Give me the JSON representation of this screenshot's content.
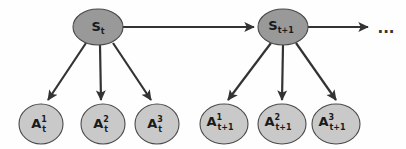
{
  "figure": {
    "title": "",
    "colors": {
      "background": "#fefefe",
      "state_node_fill": "#999999",
      "action_node_fill": "#c9c9c9",
      "node_stroke": "#4a4a4a",
      "edge_stroke": "#333333",
      "label_color": "#1a1a1a"
    },
    "continuation_label": "..."
  },
  "nodes": {
    "state_t": {
      "id": "S_t",
      "base": "S",
      "subscript": "t",
      "superscript": "",
      "kind": "state"
    },
    "state_t1": {
      "id": "S_t+1",
      "base": "S",
      "subscript": "t+1",
      "superscript": "",
      "kind": "state"
    },
    "action_t_1": {
      "id": "A_t^1",
      "base": "A",
      "subscript": "t",
      "superscript": "1",
      "kind": "action"
    },
    "action_t_2": {
      "id": "A_t^2",
      "base": "A",
      "subscript": "t",
      "superscript": "2",
      "kind": "action"
    },
    "action_t_3": {
      "id": "A_t^3",
      "base": "A",
      "subscript": "t",
      "superscript": "3",
      "kind": "action"
    },
    "action_t1_1": {
      "id": "A_t+1^1",
      "base": "A",
      "subscript": "t+1",
      "superscript": "1",
      "kind": "action"
    },
    "action_t1_2": {
      "id": "A_t+1^2",
      "base": "A",
      "subscript": "t+1",
      "superscript": "2",
      "kind": "action"
    },
    "action_t1_3": {
      "id": "A_t+1^3",
      "base": "A",
      "subscript": "t+1",
      "superscript": "3",
      "kind": "action"
    }
  },
  "edges": [
    {
      "from": "S_t",
      "to": "S_t+1",
      "style": "arrow"
    },
    {
      "from": "S_t",
      "to": "A_t^1",
      "style": "arrow"
    },
    {
      "from": "S_t",
      "to": "A_t^2",
      "style": "arrow"
    },
    {
      "from": "S_t",
      "to": "A_t^3",
      "style": "arrow"
    },
    {
      "from": "S_t+1",
      "to": "...",
      "style": "arrow"
    },
    {
      "from": "S_t+1",
      "to": "A_t+1^1",
      "style": "arrow"
    },
    {
      "from": "S_t+1",
      "to": "A_t+1^2",
      "style": "arrow"
    },
    {
      "from": "S_t+1",
      "to": "A_t+1^3",
      "style": "arrow"
    }
  ]
}
